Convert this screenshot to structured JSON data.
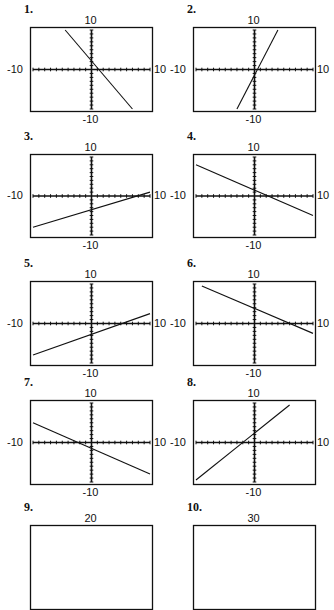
{
  "chart_data": [
    {
      "type": "line",
      "id": 1,
      "label": "1.",
      "title": "1.",
      "xlim": [
        -10,
        10
      ],
      "ylim": [
        -10,
        10
      ],
      "tick_labels": {
        "top": "10",
        "bottom": "-10",
        "left": "-10",
        "right": "10"
      },
      "line": {
        "x1": -4.5,
        "y1": 10,
        "x2": 7,
        "y2": -10,
        "slope": -1.7,
        "y_intercept": 5,
        "x_intercept": 2.9
      }
    },
    {
      "type": "line",
      "id": 2,
      "label": "2.",
      "title": "2.",
      "xlim": [
        -10,
        10
      ],
      "ylim": [
        -10,
        10
      ],
      "tick_labels": {
        "top": "10",
        "bottom": "-10",
        "left": "-10",
        "right": "10"
      },
      "line": {
        "x1": -3,
        "y1": -10,
        "x2": 4,
        "y2": 10,
        "slope": 3,
        "y_intercept": -1,
        "x_intercept": 0.3
      }
    },
    {
      "type": "line",
      "id": 3,
      "label": "3.",
      "title": "3.",
      "xlim": [
        -10,
        10
      ],
      "ylim": [
        -10,
        10
      ],
      "tick_labels": {
        "top": "10",
        "bottom": "-10",
        "left": "-10",
        "right": "10"
      },
      "line": {
        "x1": -10,
        "y1": -8,
        "x2": 10,
        "y2": 1,
        "slope": 0.45,
        "y_intercept": -3.5,
        "x_intercept": 7.8
      }
    },
    {
      "type": "line",
      "id": 4,
      "label": "4.",
      "title": "4.",
      "xlim": [
        -10,
        10
      ],
      "ylim": [
        -10,
        10
      ],
      "tick_labels": {
        "top": "10",
        "bottom": "-10",
        "left": "-10",
        "right": "10"
      },
      "line": {
        "x1": -10,
        "y1": 8,
        "x2": 10,
        "y2": -5,
        "slope": -0.65,
        "y_intercept": 2,
        "x_intercept": 2.5
      }
    },
    {
      "type": "line",
      "id": 5,
      "label": "5.",
      "title": "5.",
      "xlim": [
        -10,
        10
      ],
      "ylim": [
        -10,
        10
      ],
      "tick_labels": {
        "top": "10",
        "bottom": "-10",
        "left": "-10",
        "right": "10"
      },
      "line": {
        "x1": -10,
        "y1": -8,
        "x2": 10,
        "y2": 2.5,
        "slope": 0.5,
        "y_intercept": -3,
        "x_intercept": 5
      }
    },
    {
      "type": "line",
      "id": 6,
      "label": "6.",
      "title": "6.",
      "xlim": [
        -10,
        10
      ],
      "ylim": [
        -10,
        10
      ],
      "tick_labels": {
        "top": "10",
        "bottom": "-10",
        "left": "-10",
        "right": "10"
      },
      "line": {
        "x1": -9,
        "y1": 9.5,
        "x2": 10,
        "y2": -2.5,
        "slope": -0.6,
        "y_intercept": 4,
        "x_intercept": 6
      }
    },
    {
      "type": "line",
      "id": 7,
      "label": "7.",
      "title": "7.",
      "xlim": [
        -10,
        10
      ],
      "ylim": [
        -10,
        10
      ],
      "tick_labels": {
        "top": "10",
        "bottom": "-10",
        "left": "-10",
        "right": "10"
      },
      "line": {
        "x1": -10,
        "y1": 5,
        "x2": 10,
        "y2": -8,
        "slope": -0.65,
        "y_intercept": -2,
        "x_intercept": -3
      }
    },
    {
      "type": "line",
      "id": 8,
      "label": "8.",
      "title": "8.",
      "xlim": [
        -10,
        10
      ],
      "ylim": [
        -10,
        10
      ],
      "tick_labels": {
        "top": "10",
        "bottom": "-10",
        "left": "-10",
        "right": "10"
      },
      "line": {
        "x1": -10,
        "y1": -9.5,
        "x2": 6,
        "y2": 9.5,
        "slope": 1.2,
        "y_intercept": 3,
        "x_intercept": -2.5
      }
    },
    {
      "type": "line",
      "id": 9,
      "label": "9.",
      "title": "9.",
      "tick_labels": {
        "top": "20"
      },
      "partial": true
    },
    {
      "type": "line",
      "id": 10,
      "label": "10.",
      "title": "10.",
      "tick_labels": {
        "top": "30"
      },
      "partial": true
    }
  ],
  "panels": [
    {
      "num": "1.",
      "top": "10",
      "bottom": "-10",
      "left": "-10",
      "right": "10"
    },
    {
      "num": "2.",
      "top": "10",
      "bottom": "-10",
      "left": "-10",
      "right": "10"
    },
    {
      "num": "3.",
      "top": "10",
      "bottom": "-10",
      "left": "-10",
      "right": "10"
    },
    {
      "num": "4.",
      "top": "10",
      "bottom": "-10",
      "left": "-10",
      "right": "10"
    },
    {
      "num": "5.",
      "top": "10",
      "bottom": "-10",
      "left": "-10",
      "right": "10"
    },
    {
      "num": "6.",
      "top": "10",
      "bottom": "-10",
      "left": "-10",
      "right": "10"
    },
    {
      "num": "7.",
      "top": "10",
      "bottom": "-10",
      "left": "-10",
      "right": "10"
    },
    {
      "num": "8.",
      "top": "10",
      "bottom": "-10",
      "left": "-10",
      "right": "10"
    },
    {
      "num": "9.",
      "top": "20"
    },
    {
      "num": "10.",
      "top": "30"
    }
  ]
}
